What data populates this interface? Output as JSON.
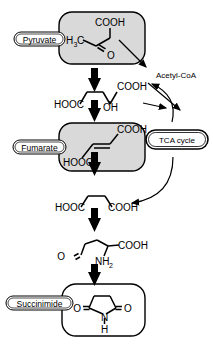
{
  "diagram": {
    "type": "biochemical-pathway",
    "orientation": "bottom-to-top",
    "background_color": "#ffffff",
    "stroke_color": "#000000",
    "box_fill_shaded": "#d9d9d9",
    "box_fill_plain": "#ffffff"
  },
  "labels": {
    "pyruvate": "Pyruvate",
    "fumarate": "Fumarate",
    "succinimide": "Succinimide",
    "tca_cycle": "TCA cycle",
    "acetyl_coa": "Acetyl-CoA"
  },
  "structures": {
    "pyruvate": {
      "name": "Pyruvate",
      "shaded": true,
      "atom_labels": [
        "H",
        "3",
        "C",
        "COOH",
        "O"
      ],
      "formula_text": "H3C-C(=O)-COOH"
    },
    "malate": {
      "name": "Malate",
      "shaded": false,
      "atom_labels": [
        "HOOC",
        "OH",
        "COOH"
      ],
      "formula_text": "HOOC-CH2-CH(OH)-COOH"
    },
    "fumarate": {
      "name": "Fumarate",
      "shaded": true,
      "atom_labels": [
        "HOOC",
        "COOH"
      ],
      "formula_text": "HOOC-CH=CH-COOH"
    },
    "succinate": {
      "name": "Succinate",
      "shaded": false,
      "atom_labels": [
        "HOOC",
        "COOH"
      ],
      "formula_text": "HOOC-CH2-CH2-COOH"
    },
    "aspartate_semialdehyde": {
      "name": "Ring-opened succinimide amino acid",
      "shaded": false,
      "atom_labels": [
        "O",
        "NH",
        "2",
        "COOH"
      ],
      "formula_text": "O=CH-CH2-CH2-CH(NH2)-COOH"
    },
    "succinimide": {
      "name": "Succinimide",
      "shaded": false,
      "atom_labels": [
        "O",
        "O",
        "N",
        "H"
      ],
      "formula_text": "cyclic imide: O=C-CH2-CH2-C=O with N-H"
    }
  },
  "arrows": {
    "block_arrows": [
      {
        "id": "succinimide-to-aminoacid",
        "direction": "up"
      },
      {
        "id": "aminoacid-to-succinate",
        "direction": "up"
      },
      {
        "id": "succinate-to-fumarate",
        "direction": "up"
      },
      {
        "id": "fumarate-to-malate",
        "direction": "up"
      },
      {
        "id": "malate-to-pyruvate",
        "direction": "up"
      }
    ],
    "thin_arrows": [
      {
        "id": "pyruvate-to-acetylcoa",
        "direction": "down-right"
      },
      {
        "id": "acetylcoa-to-tca",
        "direction": "down-right"
      },
      {
        "id": "malate-to-tca",
        "direction": "right"
      },
      {
        "id": "tca-up-curve",
        "direction": "curve-up-left"
      },
      {
        "id": "tca-to-succinate",
        "direction": "curve-down-left"
      }
    ]
  }
}
